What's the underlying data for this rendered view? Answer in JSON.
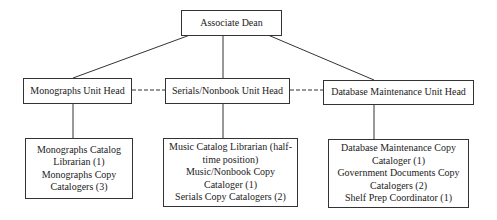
{
  "chart": {
    "root": {
      "label": "Associate Dean"
    },
    "heads": [
      {
        "label": "Monographs Unit Head",
        "staff": [
          "Monographs Catalog Librarian (1)",
          "Monographs Copy Catalogers (3)"
        ]
      },
      {
        "label": "Serials/Nonbook Unit Head",
        "staff": [
          "Music Catalog Librarian (half-time position)",
          "Music/Nonbook Copy Cataloger (1)",
          "Serials Copy Catalogers (2)"
        ]
      },
      {
        "label": "Database Maintenance Unit Head",
        "staff": [
          "Database Maintenance Copy Cataloger (1)",
          "Government Documents Copy Catalogers (2)",
          "Shelf Prep Coordinator (1)"
        ]
      }
    ]
  }
}
